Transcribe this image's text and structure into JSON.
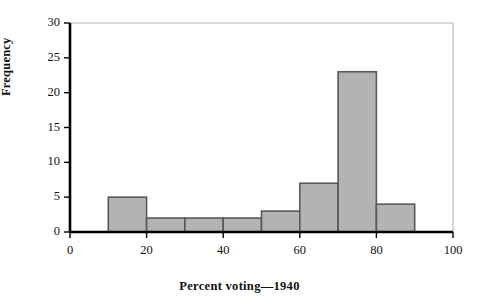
{
  "chart_data": {
    "type": "bar",
    "title": "",
    "subtitle": "",
    "xlabel": "Percent voting—1940",
    "ylabel": "Frequency",
    "bin_width": 10,
    "bin_edges": [
      10,
      20,
      30,
      40,
      50,
      60,
      70,
      80,
      90
    ],
    "categories": [
      "10–20",
      "20–30",
      "30–40",
      "40–50",
      "50–60",
      "60–70",
      "70–80",
      "80–90"
    ],
    "values": [
      5,
      2,
      2,
      2,
      3,
      7,
      23,
      4
    ],
    "xlim": [
      0,
      100
    ],
    "ylim": [
      0,
      30
    ],
    "xticks": [
      0,
      20,
      40,
      60,
      80,
      100
    ],
    "xtick_labels": [
      "0",
      "20",
      "40",
      "60",
      "80",
      "100"
    ],
    "yticks": [
      0,
      5,
      10,
      15,
      20,
      25,
      30
    ],
    "ytick_labels": [
      "0",
      "5",
      "10",
      "15",
      "20",
      "25",
      "30"
    ],
    "grid": false,
    "legend": null,
    "bar_fill_color": "#b3b3b3",
    "bar_edge_color": "#585858",
    "axis_color": "#000000",
    "frame_color": "#b9b9b9"
  }
}
